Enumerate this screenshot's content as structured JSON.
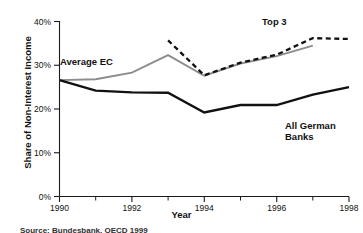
{
  "chart_data": {
    "type": "line",
    "title": "",
    "xlabel": "Year",
    "ylabel": "Share of Non-Interest Income",
    "xlim": [
      1990,
      1998
    ],
    "ylim": [
      0,
      40
    ],
    "grid": false,
    "legend_position": "inline-annotations",
    "x_tick_labels": [
      "1990",
      "1992",
      "1994",
      "1996",
      "1998"
    ],
    "x_ticks": [
      1990,
      1992,
      1994,
      1996,
      1998
    ],
    "x_minor_ticks": [
      1991,
      1993,
      1995,
      1997
    ],
    "y_tick_labels": [
      "0%",
      "10%",
      "20%",
      "30%",
      "40%"
    ],
    "y_ticks": [
      0,
      10,
      20,
      30,
      40
    ],
    "y_unit": "%",
    "series": [
      {
        "name": "Average EC",
        "style": "solid",
        "color": "#8c8c8c",
        "width": 1.9,
        "x": [
          1990,
          1991,
          1992,
          1993,
          1994,
          1995,
          1996,
          1997
        ],
        "values": [
          26.6,
          26.8,
          28.3,
          32.3,
          27.6,
          30.4,
          32.1,
          34.5
        ]
      },
      {
        "name": "Top 3",
        "style": "dashed",
        "color": "#111111",
        "width": 2.3,
        "x": [
          1993,
          1994,
          1995,
          1996,
          1997,
          1998
        ],
        "values": [
          35.7,
          27.7,
          30.6,
          32.4,
          36.2,
          36.0
        ]
      },
      {
        "name": "All German Banks",
        "style": "solid",
        "color": "#111111",
        "width": 2.4,
        "x": [
          1990,
          1991,
          1992,
          1993,
          1994,
          1995,
          1996,
          1997,
          1998
        ],
        "values": [
          26.6,
          24.2,
          23.8,
          23.7,
          19.2,
          20.9,
          20.9,
          23.3,
          25.0
        ]
      }
    ],
    "annotations": [
      {
        "text": "Average EC",
        "x": 1991.2,
        "y": 30.5
      },
      {
        "text": "Top 3",
        "x": 1996.5,
        "y": 38.2
      },
      {
        "text": "All German",
        "x": 1997.0,
        "y": 16.5
      },
      {
        "text": "Banks",
        "x": 1997.0,
        "y": 14.0
      }
    ]
  },
  "labels": {
    "average_ec": "Average EC",
    "top3": "Top 3",
    "all_german_banks_line1": "All German",
    "all_german_banks_line2": "Banks",
    "y_axis_title": "Share of Non-Interest Income",
    "x_axis_title": "Year",
    "y_0": "0%",
    "y_10": "10%",
    "y_20": "20%",
    "y_30": "30%",
    "y_40": "40%",
    "x_1990": "1990",
    "x_1992": "1992",
    "x_1994": "1994",
    "x_1996": "1996",
    "x_1998": "1998"
  },
  "footnote": {
    "text": "Source: Bundesbank, OECD 1999"
  },
  "colors": {
    "average_ec": "#8c8c8c",
    "top3": "#111111",
    "all_german_banks": "#111111",
    "axis": "#1a1a1a",
    "background": "#ffffff"
  }
}
